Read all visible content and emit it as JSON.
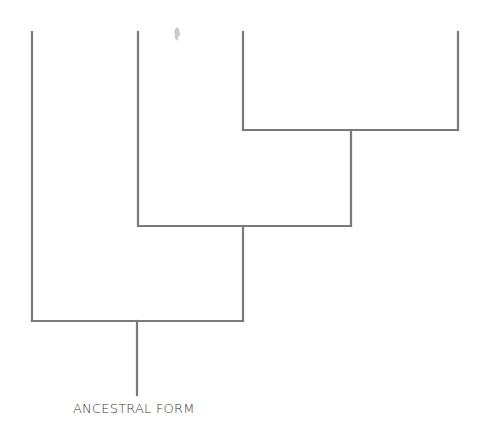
{
  "diagram": {
    "type": "cladogram",
    "line_color": "#7a7a7a",
    "line_width": 2.2,
    "root_label": "ANCESTRAL FORM",
    "branches": [
      {
        "name": "lineage-1",
        "x": 32,
        "top": 32,
        "bottom": 321
      },
      {
        "name": "lineage-2",
        "x": 138,
        "top": 32,
        "bottom": 226
      },
      {
        "name": "lineage-3",
        "x": 243,
        "top": 32,
        "bottom": 130
      },
      {
        "name": "lineage-4",
        "x": 458,
        "top": 32,
        "bottom": 130
      }
    ],
    "nodes": [
      {
        "name": "node-3-4",
        "x1": 243,
        "x2": 458,
        "y": 130,
        "stem_x": 351,
        "stem_bottom": 226
      },
      {
        "name": "node-2-34",
        "x1": 138,
        "x2": 351,
        "y": 226,
        "stem_x": 243,
        "stem_bottom": 321
      },
      {
        "name": "node-1-234",
        "x1": 32,
        "x2": 243,
        "y": 321,
        "stem_x": 137,
        "stem_bottom": 395
      }
    ]
  }
}
